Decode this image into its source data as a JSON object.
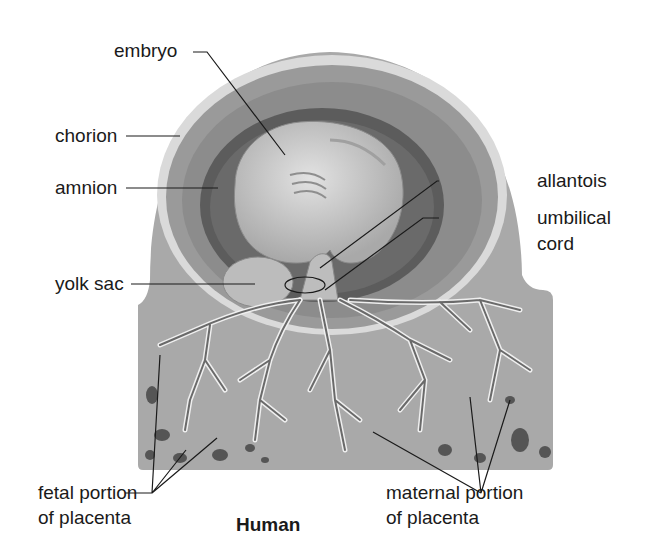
{
  "diagram": {
    "title": "Human",
    "labels": {
      "embryo": "embryo",
      "chorion": "chorion",
      "amnion": "amnion",
      "yolk_sac": "yolk sac",
      "allantois": "allantois",
      "umbilical_cord_line1": "umbilical",
      "umbilical_cord_line2": "cord",
      "fetal_placenta_line1": "fetal portion",
      "fetal_placenta_line2": "of placenta",
      "maternal_placenta_line1": "maternal portion",
      "maternal_placenta_line2": "of placenta"
    },
    "colors": {
      "background": "#ffffff",
      "outer_tissue": "#a8a8a8",
      "chorion_band": "#d8d8d8",
      "chorionic_cavity": "#8e8e8e",
      "amnion_cavity": "#5e5e5e",
      "embryo": "#c8c8c8",
      "villi": "#6a6a6a",
      "leader_lines": "#1a1a1a",
      "text": "#1a1a1a"
    }
  }
}
